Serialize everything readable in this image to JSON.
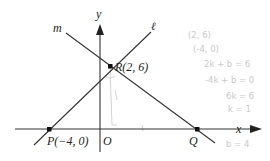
{
  "diagram": {
    "axes": {
      "x_label": "x",
      "y_label": "y",
      "origin_label": "O"
    },
    "lines": [
      {
        "name": "ℓ",
        "through": [
          "P",
          "R"
        ]
      },
      {
        "name": "m",
        "through": [
          "R",
          "Q"
        ]
      }
    ],
    "points": {
      "P": {
        "label": "P(−4, 0)",
        "x": -4,
        "y": 0
      },
      "R": {
        "label": "R(2, 6)",
        "x": 2,
        "y": 6
      },
      "Q": {
        "label": "Q",
        "x": null,
        "y": 0
      }
    },
    "line_labels": {
      "l": "ℓ",
      "m": "m"
    },
    "handwritten_notes": [
      "(2, 6)",
      "(-4, 0)",
      "2k + b = 6",
      "-4k + b = 0",
      "6k = 6",
      "k = 1",
      "b = 4"
    ],
    "colors": {
      "line": "#333333",
      "text": "#222222",
      "pencil": "#c8c8c8"
    }
  }
}
